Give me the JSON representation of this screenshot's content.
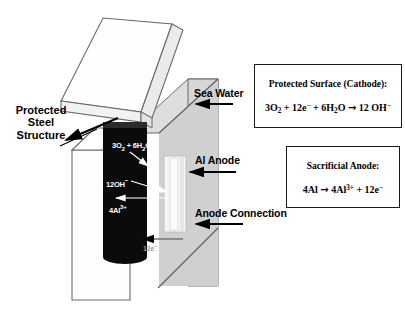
{
  "figure": {
    "colors": {
      "steel_column": "#0b0b0b",
      "sea_water": "#d2d2d2",
      "sea_water_front": "#c9c9c9",
      "structure_white": "#fdfdfd",
      "anode_bar": "#f2f2f2",
      "outline": "#555555",
      "text": "#000000",
      "text_on_dark": "#ffffff",
      "box_border": "#1a1a1a",
      "electron_label": "#9a9a9a"
    }
  },
  "labels": {
    "protected_steel_structure": "Protected\nSteel\nStructure",
    "protected_steel_structure_lines": [
      "Protected",
      "Steel",
      "Structure"
    ],
    "sea_water": "Sea Water",
    "al_anode": "Al Anode",
    "anode_connection": "Anode Connection"
  },
  "reaction_labels": {
    "cathode_reactants": {
      "text": "3O2 + 6H2O",
      "parts": [
        "3O",
        "2",
        " + 6H",
        "2",
        "O"
      ]
    },
    "hydroxide": {
      "text": "12OH-",
      "parts": [
        "12OH",
        "−"
      ]
    },
    "aluminium_ion": {
      "text": "4Al3+",
      "parts": [
        "4Al",
        "3+"
      ]
    },
    "electrons": {
      "text": "12e-",
      "parts": [
        "12e",
        "−"
      ]
    }
  },
  "equation_boxes": [
    {
      "id": "cathode",
      "title": "Protected Surface (Cathode):",
      "equation_plain": "3O2 + 12e- + 6H2O → 12 OH-",
      "equation": {
        "lhs": [
          {
            "t": "3O"
          },
          {
            "sub": "2"
          },
          {
            "t": " + 12e"
          },
          {
            "sup": "−"
          },
          {
            "t": " + 6H"
          },
          {
            "sub": "2"
          },
          {
            "t": "O"
          }
        ],
        "arrow": "→",
        "rhs": [
          {
            "t": " 12 OH"
          },
          {
            "sup": "−"
          }
        ]
      }
    },
    {
      "id": "anode",
      "title": "Sacrificial Anode:",
      "equation_plain": "4Al → 4Al3+ + 12e-",
      "equation": {
        "lhs": [
          {
            "t": "4Al"
          }
        ],
        "arrow": "→",
        "rhs": [
          {
            "t": " 4Al"
          },
          {
            "sup": "3+"
          },
          {
            "t": " + 12e"
          },
          {
            "sup": "−"
          }
        ]
      }
    }
  ]
}
